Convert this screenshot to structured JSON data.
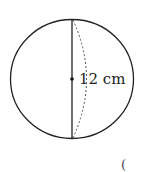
{
  "diagram": {
    "shape": "sphere",
    "diameter_label": "12 cm",
    "answer_bracket": "(",
    "colors": {
      "stroke": "#222222",
      "dashed": "#555555",
      "background": "#ffffff"
    }
  }
}
